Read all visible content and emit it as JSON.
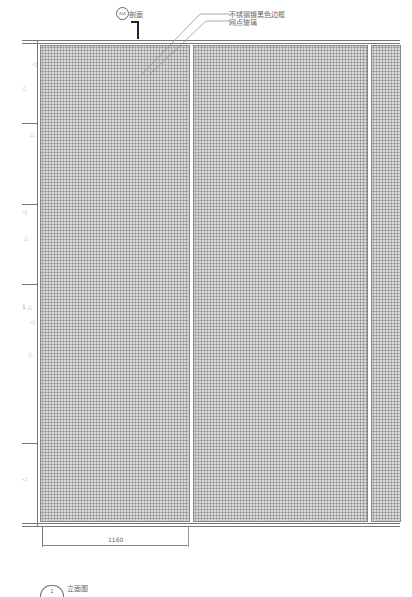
{
  "drawing": {
    "section_marker": {
      "symbol": "A/A",
      "label": "剖面"
    },
    "callouts": [
      "不锈钢镀黑色边框",
      "网点玻璃"
    ],
    "dimension": "1160",
    "title": {
      "number": "1",
      "label": "立面图"
    },
    "panels": 3,
    "colors": {
      "line": "#777777",
      "fill": "#d8d8d8",
      "dot": "#8a8a8a"
    }
  }
}
